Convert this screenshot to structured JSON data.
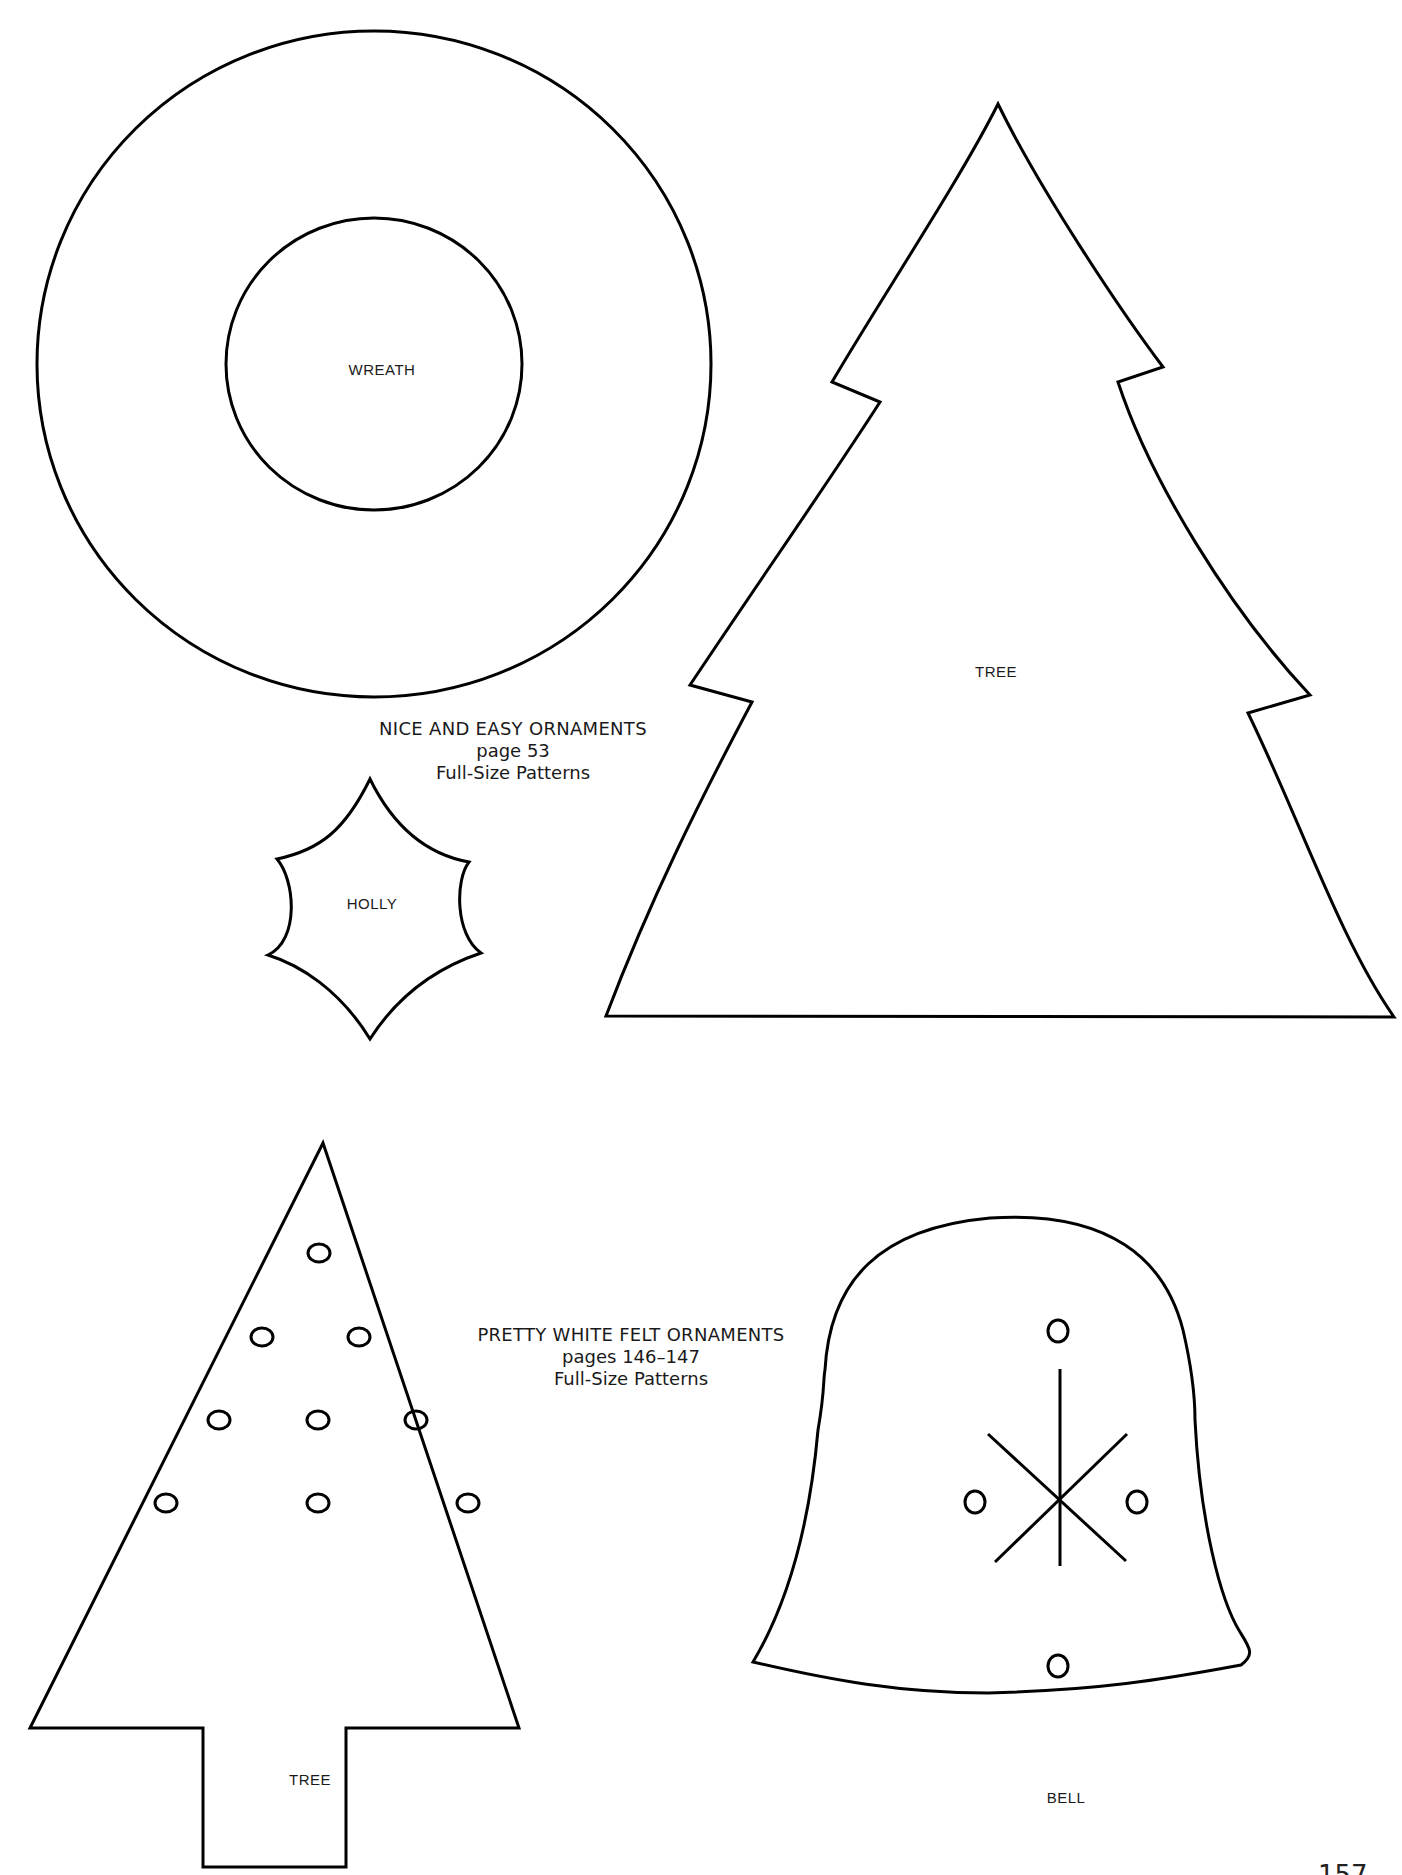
{
  "sections": [
    {
      "title": "NICE AND EASY ORNAMENTS",
      "pages": "page 53",
      "subtitle": "Full-Size Patterns"
    },
    {
      "title": "PRETTY WHITE FELT ORNAMENTS",
      "pages": "pages 146–147",
      "subtitle": "Full-Size Patterns"
    }
  ],
  "patterns": {
    "wreath": {
      "label": "WREATH"
    },
    "tree_large": {
      "label": "TREE"
    },
    "holly": {
      "label": "HOLLY"
    },
    "tree_felt": {
      "label": "TREE",
      "dot_count": 9
    },
    "bell": {
      "label": "BELL",
      "dot_count": 4
    }
  },
  "page_number": "157",
  "colors": {
    "line": "#000000",
    "background": "#ffffff",
    "text": "#1a1a1a"
  }
}
